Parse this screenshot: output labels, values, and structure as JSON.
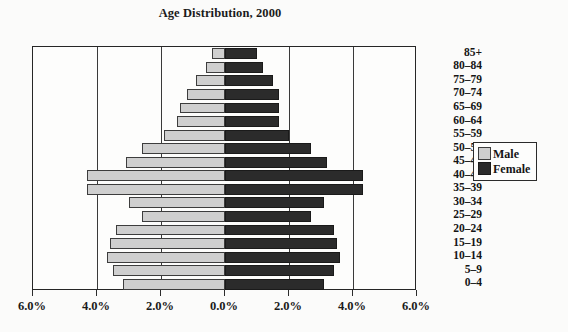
{
  "chart_data": {
    "type": "bar",
    "subtype": "population-pyramid",
    "title": "Age Distribution, 2000",
    "xlabel": "",
    "ylabel": "",
    "orientation": "horizontal",
    "grid": true,
    "legend_position": "right",
    "xlim": [
      -6.0,
      6.0
    ],
    "xtick_values": [
      -6.0,
      -4.0,
      -2.0,
      0.0,
      2.0,
      4.0,
      6.0
    ],
    "xtick_labels": [
      "6.0%",
      "4.0%",
      "2.0%",
      "0.0%",
      "2.0%",
      "4.0%",
      "6.0%"
    ],
    "gridline_values": [
      -4.0,
      -2.0,
      2.0,
      4.0
    ],
    "categories": [
      "85+",
      "80–84",
      "75–79",
      "70–74",
      "65–69",
      "60–64",
      "55–59",
      "50–54",
      "45–49",
      "40–44",
      "35–39",
      "30–34",
      "25–29",
      "20–24",
      "15–19",
      "10–14",
      "5–9",
      "0–4"
    ],
    "series": [
      {
        "name": "Male",
        "side": "left",
        "color": "#cfcfcf",
        "values": [
          0.4,
          0.6,
          0.9,
          1.2,
          1.4,
          1.5,
          1.9,
          2.6,
          3.1,
          4.3,
          4.3,
          3.0,
          2.6,
          3.4,
          3.6,
          3.7,
          3.5,
          3.2
        ]
      },
      {
        "name": "Female",
        "side": "right",
        "color": "#2b2b2b",
        "values": [
          1.0,
          1.2,
          1.5,
          1.7,
          1.7,
          1.7,
          2.0,
          2.7,
          3.2,
          4.3,
          4.3,
          3.1,
          2.7,
          3.4,
          3.5,
          3.6,
          3.4,
          3.1
        ]
      }
    ]
  },
  "legend": {
    "items": [
      {
        "label": "Male",
        "swatch": "male-swatch"
      },
      {
        "label": "Female",
        "swatch": "female-swatch"
      }
    ]
  }
}
